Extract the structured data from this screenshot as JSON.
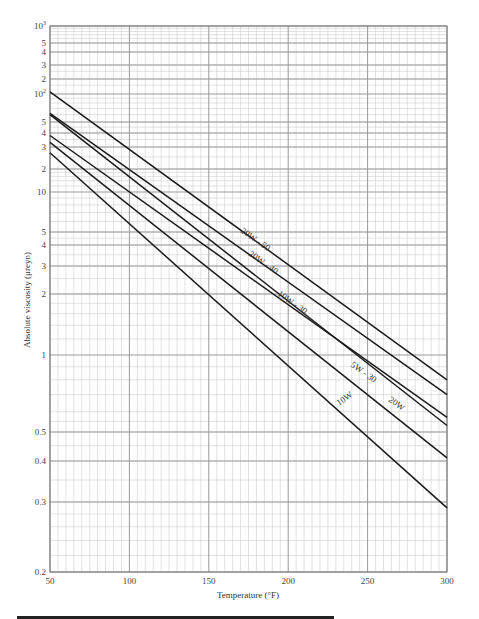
{
  "chart_data": {
    "type": "line",
    "title": "",
    "xlabel": "Temperature (°F)",
    "ylabel": "Absolute viscosity (μreyn)",
    "xlim": [
      50,
      300
    ],
    "ylim": [
      0.2,
      1000
    ],
    "yscale": "viscosity-log (ASTM-style)",
    "grid": true,
    "legend": "inline labels on lines",
    "x_ticks": [
      50,
      100,
      150,
      200,
      250,
      300
    ],
    "x_tick_labels": [
      "50",
      "100",
      "150",
      "200",
      "250",
      "300"
    ],
    "y_tick_labels": [
      {
        "value": 1000,
        "label": "10³"
      },
      {
        "value": 500,
        "label": "5"
      },
      {
        "value": 400,
        "label": "4"
      },
      {
        "value": 300,
        "label": "3"
      },
      {
        "value": 200,
        "label": "2"
      },
      {
        "value": 100,
        "label": "10²"
      },
      {
        "value": 50,
        "label": "5"
      },
      {
        "value": 40,
        "label": "4"
      },
      {
        "value": 30,
        "label": "3"
      },
      {
        "value": 20,
        "label": "2"
      },
      {
        "value": 10,
        "label": "10"
      },
      {
        "value": 5,
        "label": "5"
      },
      {
        "value": 4,
        "label": "4"
      },
      {
        "value": 3,
        "label": "3"
      },
      {
        "value": 2,
        "label": "2"
      },
      {
        "value": 1,
        "label": "1"
      },
      {
        "value": 0.5,
        "label": "0.5"
      },
      {
        "value": 0.4,
        "label": "0.4"
      },
      {
        "value": 0.3,
        "label": "0.3"
      },
      {
        "value": 0.2,
        "label": "0.2"
      }
    ],
    "series": [
      {
        "name": "20W - 50",
        "x": [
          50,
          300
        ],
        "y": [
          110,
          0.8
        ],
        "label_pos": {
          "x": 240,
          "y": 232,
          "angle": 35
        }
      },
      {
        "name": "20W - 40",
        "x": [
          50,
          300
        ],
        "y": [
          62,
          0.7
        ],
        "label_pos": {
          "x": 248,
          "y": 255,
          "angle": 35
        }
      },
      {
        "name": "10W - 30",
        "x": [
          50,
          300
        ],
        "y": [
          38,
          0.57
        ],
        "label_pos": {
          "x": 277,
          "y": 295,
          "angle": 35
        }
      },
      {
        "name": "20W",
        "x": [
          50,
          300
        ],
        "y": [
          60,
          0.53
        ],
        "label_pos": {
          "x": 388,
          "y": 401,
          "angle": 35
        }
      },
      {
        "name": "5W - 30",
        "x": [
          50,
          300
        ],
        "y": [
          33,
          0.41
        ],
        "label_pos": {
          "x": 350,
          "y": 366,
          "angle": 35
        }
      },
      {
        "name": "10W",
        "x": [
          50,
          300
        ],
        "y": [
          27,
          0.29
        ],
        "label_pos": {
          "x": 339,
          "y": 406,
          "angle": -35
        }
      }
    ]
  },
  "layout": {
    "plot": {
      "left": 50,
      "top": 26,
      "right": 447,
      "bottom": 572
    },
    "y_anchors": [
      [
        1000,
        26
      ],
      [
        500,
        43
      ],
      [
        400,
        52
      ],
      [
        300,
        65
      ],
      [
        200,
        79
      ],
      [
        100,
        94
      ],
      [
        50,
        122
      ],
      [
        40,
        133
      ],
      [
        30,
        147
      ],
      [
        20,
        169
      ],
      [
        10,
        192
      ],
      [
        5,
        232
      ],
      [
        4,
        245
      ],
      [
        3,
        266
      ],
      [
        2,
        294
      ],
      [
        1,
        355
      ],
      [
        0.5,
        432
      ],
      [
        0.4,
        461
      ],
      [
        0.3,
        502
      ],
      [
        0.2,
        572
      ]
    ],
    "x_minor_step": 5
  }
}
